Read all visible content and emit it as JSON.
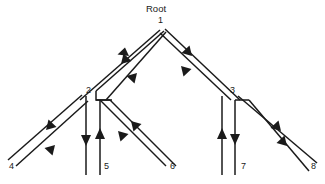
{
  "diagram": {
    "title_label": "Root",
    "type": "tree-traversal-diagram",
    "stroke_color": "#1a1a1a",
    "background_color": "#ffffff",
    "nodes": [
      {
        "id": "n1",
        "label": "1",
        "x": 162,
        "y": 22,
        "label_x": 158,
        "label_y": 16
      },
      {
        "id": "n2",
        "label": "2",
        "x": 88,
        "y": 93,
        "label_x": 86,
        "label_y": 86
      },
      {
        "id": "n3",
        "label": "3",
        "x": 232,
        "y": 93,
        "label_x": 230,
        "label_y": 86
      },
      {
        "id": "n4",
        "label": "4",
        "x": 12,
        "y": 166,
        "label_x": 9,
        "label_y": 162
      },
      {
        "id": "n5",
        "label": "5",
        "x": 106,
        "y": 166,
        "label_x": 104,
        "label_y": 162
      },
      {
        "id": "n6",
        "label": "6",
        "x": 172,
        "y": 166,
        "label_x": 170,
        "label_y": 162
      },
      {
        "id": "n7",
        "label": "7",
        "x": 243,
        "y": 166,
        "label_x": 241,
        "label_y": 162
      },
      {
        "id": "n8",
        "label": "8",
        "x": 313,
        "y": 166,
        "label_x": 311,
        "label_y": 162
      }
    ],
    "root_label": {
      "text": "Root",
      "x": 146,
      "y": 4
    },
    "edges": [
      {
        "name": "edge-1-to-2-down",
        "from": "1",
        "to": "2",
        "direction": "down-left"
      },
      {
        "name": "edge-2-to-1-up",
        "from": "2",
        "to": "1",
        "direction": "up-right"
      },
      {
        "name": "edge-1-to-3-down",
        "from": "1",
        "to": "3",
        "direction": "down-right"
      },
      {
        "name": "edge-3-to-1-up",
        "from": "3",
        "to": "1",
        "direction": "up-left"
      },
      {
        "name": "edge-2-to-4-down",
        "from": "2",
        "to": "4",
        "direction": "down-left"
      },
      {
        "name": "edge-4-to-2-up",
        "from": "4",
        "to": "2",
        "direction": "up-right"
      },
      {
        "name": "edge-2-to-5-down",
        "from": "2",
        "to": "5",
        "direction": "down"
      },
      {
        "name": "edge-5-to-2-up",
        "from": "5",
        "to": "2",
        "direction": "up"
      },
      {
        "name": "edge-2-to-6-down",
        "from": "2",
        "to": "6",
        "direction": "down-right"
      },
      {
        "name": "edge-6-to-2-up",
        "from": "6",
        "to": "2",
        "direction": "up-left"
      },
      {
        "name": "edge-3-to-7-down",
        "from": "3",
        "to": "7",
        "direction": "down"
      },
      {
        "name": "edge-7-to-3-up",
        "from": "7",
        "to": "3",
        "direction": "up"
      },
      {
        "name": "edge-3-to-8-down",
        "from": "3",
        "to": "8",
        "direction": "down-right"
      },
      {
        "name": "edge-8-to-3-up",
        "from": "8",
        "to": "3",
        "direction": "up-left"
      }
    ]
  }
}
